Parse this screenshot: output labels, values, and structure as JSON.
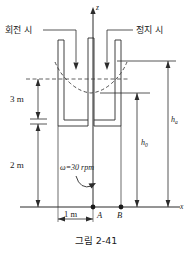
{
  "figure": {
    "caption": "그림 2-41",
    "axes": {
      "vertical_label": "z",
      "horizontal_label": "x"
    },
    "annotations": {
      "rotating_label": "회전 시",
      "static_label": "정지 시",
      "omega_label": "ω=30 rpm"
    },
    "dimensions": {
      "upper_vertical": "3 m",
      "lower_vertical": "2 m",
      "horizontal": "1 m"
    },
    "points": {
      "a": "A",
      "b": "B"
    },
    "heights": {
      "h_zero": "h",
      "h_zero_sub": "0",
      "h_a": "h",
      "h_a_sub": "a"
    },
    "colors": {
      "line": "#2b2b2b",
      "dashed": "#3a3a3a",
      "text": "#1a1a1a"
    }
  }
}
